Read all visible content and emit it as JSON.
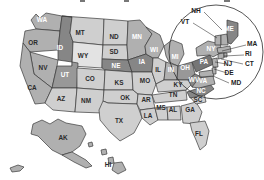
{
  "image": {
    "title": "United States map with state abbreviations",
    "width": 264,
    "height": 180,
    "background": "#ffffff",
    "border_color": "#3a3a3a"
  },
  "legend_colors": {
    "very_light": "#e3e3e3",
    "light": "#cfcfcf",
    "medium": "#b0b0b0",
    "medium_dark": "#989898",
    "dark": "#868686",
    "darkest": "#767676",
    "label_dark": "#2b2b2b",
    "label_white": "#ffffff"
  },
  "magnifier": {
    "name": "northeast-detail-circle",
    "cx": 216,
    "cy": 52,
    "r": 47
  },
  "states": [
    {
      "abbr": "WA",
      "x": 42,
      "y": 20,
      "shade": "medium",
      "label_color": "white"
    },
    {
      "abbr": "OR",
      "x": 33,
      "y": 43,
      "shade": "medium",
      "label_color": "dark"
    },
    {
      "abbr": "ID",
      "x": 60,
      "y": 48,
      "shade": "dark",
      "label_color": "white"
    },
    {
      "abbr": "MT",
      "x": 80,
      "y": 33,
      "shade": "light",
      "label_color": "dark"
    },
    {
      "abbr": "WY",
      "x": 83,
      "y": 56,
      "shade": "very_light",
      "label_color": "dark"
    },
    {
      "abbr": "ND",
      "x": 114,
      "y": 37,
      "shade": "light",
      "label_color": "dark"
    },
    {
      "abbr": "SD",
      "x": 114,
      "y": 52,
      "shade": "light",
      "label_color": "dark"
    },
    {
      "abbr": "NE",
      "x": 116,
      "y": 66,
      "shade": "dark",
      "label_color": "white"
    },
    {
      "abbr": "KS",
      "x": 119,
      "y": 83,
      "shade": "light",
      "label_color": "dark"
    },
    {
      "abbr": "NV",
      "x": 43,
      "y": 68,
      "shade": "medium",
      "label_color": "dark"
    },
    {
      "abbr": "CA",
      "x": 32,
      "y": 88,
      "shade": "medium",
      "label_color": "dark"
    },
    {
      "abbr": "UT",
      "x": 65,
      "y": 75,
      "shade": "medium_dark",
      "label_color": "white"
    },
    {
      "abbr": "CO",
      "x": 90,
      "y": 79,
      "shade": "light",
      "label_color": "dark"
    },
    {
      "abbr": "AZ",
      "x": 61,
      "y": 99,
      "shade": "light",
      "label_color": "dark"
    },
    {
      "abbr": "NM",
      "x": 86,
      "y": 101,
      "shade": "light",
      "label_color": "dark"
    },
    {
      "abbr": "OK",
      "x": 125,
      "y": 98,
      "shade": "light",
      "label_color": "dark"
    },
    {
      "abbr": "TX",
      "x": 119,
      "y": 121,
      "shade": "light",
      "label_color": "dark"
    },
    {
      "abbr": "MN",
      "x": 137,
      "y": 37,
      "shade": "medium",
      "label_color": "white"
    },
    {
      "abbr": "IA",
      "x": 142,
      "y": 62,
      "shade": "dark",
      "label_color": "white"
    },
    {
      "abbr": "MO",
      "x": 145,
      "y": 81,
      "shade": "light",
      "label_color": "dark"
    },
    {
      "abbr": "AR",
      "x": 146,
      "y": 100,
      "shade": "light",
      "label_color": "dark"
    },
    {
      "abbr": "LA",
      "x": 148,
      "y": 116,
      "shade": "light",
      "label_color": "dark"
    },
    {
      "abbr": "WI",
      "x": 154,
      "y": 50,
      "shade": "medium",
      "label_color": "white"
    },
    {
      "abbr": "IL",
      "x": 158,
      "y": 70,
      "shade": "light",
      "label_color": "dark"
    },
    {
      "abbr": "MS",
      "x": 161,
      "y": 108,
      "shade": "light",
      "label_color": "dark"
    },
    {
      "abbr": "MI",
      "x": 175,
      "y": 57,
      "shade": "medium",
      "label_color": "white"
    },
    {
      "abbr": "IN",
      "x": 171,
      "y": 70,
      "shade": "medium",
      "label_color": "white"
    },
    {
      "abbr": "KY",
      "x": 178,
      "y": 85,
      "shade": "light",
      "label_color": "dark"
    },
    {
      "abbr": "TN",
      "x": 173,
      "y": 95,
      "shade": "light",
      "label_color": "dark"
    },
    {
      "abbr": "AL",
      "x": 173,
      "y": 110,
      "shade": "light",
      "label_color": "dark"
    },
    {
      "abbr": "OH",
      "x": 185,
      "y": 68,
      "shade": "medium_dark",
      "label_color": "white"
    },
    {
      "abbr": "WV",
      "x": 194,
      "y": 80,
      "shade": "dark",
      "label_color": "white"
    },
    {
      "abbr": "VA",
      "x": 203,
      "y": 81,
      "shade": "medium",
      "label_color": "white"
    },
    {
      "abbr": "GA",
      "x": 190,
      "y": 110,
      "shade": "light",
      "label_color": "dark"
    },
    {
      "abbr": "SC",
      "x": 198,
      "y": 100,
      "shade": "light",
      "label_color": "dark"
    },
    {
      "abbr": "NC",
      "x": 201,
      "y": 91,
      "shade": "dark",
      "label_color": "white"
    },
    {
      "abbr": "FL",
      "x": 199,
      "y": 134,
      "shade": "light",
      "label_color": "dark"
    },
    {
      "abbr": "PA",
      "x": 204,
      "y": 62,
      "shade": "darkest",
      "label_color": "white"
    },
    {
      "abbr": "NY",
      "x": 211,
      "y": 49,
      "shade": "medium",
      "label_color": "white"
    },
    {
      "abbr": "ME",
      "x": 229,
      "y": 29,
      "shade": "dark",
      "label_color": "white"
    },
    {
      "abbr": "AK",
      "x": 63,
      "y": 138,
      "shade": "medium",
      "label_color": "dark"
    },
    {
      "abbr": "HI",
      "x": 108,
      "y": 165,
      "shade": "medium",
      "label_color": "dark"
    }
  ],
  "callouts": [
    {
      "abbr": "NH",
      "tx": 196,
      "ty": 11,
      "lx": 204,
      "ly": 12,
      "ex": 222,
      "ey": 30
    },
    {
      "abbr": "VT",
      "tx": 185,
      "ty": 22,
      "lx": 193,
      "ly": 23,
      "ex": 217,
      "ey": 38
    },
    {
      "abbr": "MA",
      "tx": 247,
      "ty": 44,
      "lx": 246,
      "ly": 45,
      "ex": 222,
      "ey": 51
    },
    {
      "abbr": "RI",
      "tx": 245,
      "ty": 54,
      "lx": 244,
      "ly": 55,
      "ex": 224,
      "ey": 56
    },
    {
      "abbr": "CT",
      "tx": 245,
      "ty": 64,
      "lx": 243,
      "ly": 64,
      "ex": 221,
      "ey": 59
    },
    {
      "abbr": "NJ",
      "tx": 228,
      "ty": 64,
      "lx": 226,
      "ly": 64,
      "ex": 215,
      "ey": 62
    },
    {
      "abbr": "DE",
      "tx": 229,
      "ty": 73,
      "lx": 227,
      "ly": 73,
      "ex": 214,
      "ey": 69
    },
    {
      "abbr": "MD",
      "tx": 231,
      "ty": 83,
      "lx": 229,
      "ly": 83,
      "ex": 213,
      "ey": 76
    }
  ]
}
